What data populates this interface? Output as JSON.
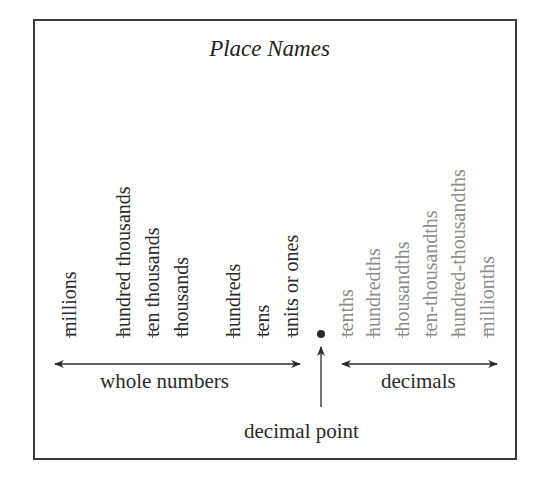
{
  "title": "Place Names",
  "whole_numbers": {
    "label": "whole numbers",
    "places": [
      {
        "name": "millions",
        "x": 69
      },
      {
        "name": "hundred thousands",
        "x": 123
      },
      {
        "name": "ten thousands",
        "x": 152
      },
      {
        "name": "thousands",
        "x": 181
      },
      {
        "name": "hundreds",
        "x": 233
      },
      {
        "name": "tens",
        "x": 262
      },
      {
        "name": "units or ones",
        "x": 291
      }
    ]
  },
  "decimals": {
    "label": "decimals",
    "places": [
      {
        "name": "tenths",
        "x": 346
      },
      {
        "name": "hundredths",
        "x": 373
      },
      {
        "name": "thousandths",
        "x": 402
      },
      {
        "name": "ten-thousandths",
        "x": 430
      },
      {
        "name": "hundred-thousandths",
        "x": 458
      },
      {
        "name": "millionths",
        "x": 487
      }
    ]
  },
  "decimal_point_label": "decimal point",
  "colors": {
    "whole_text": "#2a2a2a",
    "decimal_text": "#8c8c8c",
    "border": "#3a3a3a"
  }
}
